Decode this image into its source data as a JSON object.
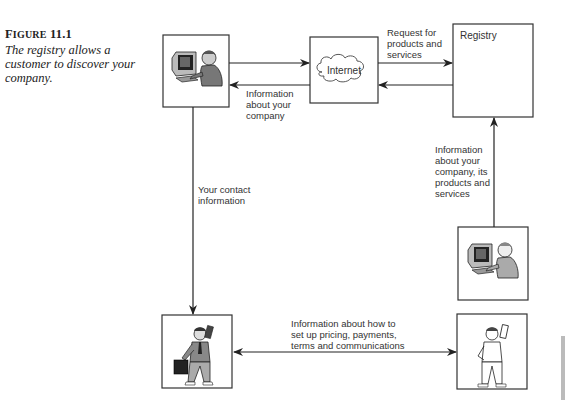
{
  "caption": {
    "figure_label_prefix": "F",
    "figure_label_smallcaps": "IGURE",
    "figure_number": "11.1",
    "text": "The registry allows a customer to discover your company."
  },
  "nodes": {
    "customer_computer": {
      "icon": "person-at-computer-icon"
    },
    "internet": {
      "label": "Internet",
      "icon": "cloud-icon"
    },
    "registry": {
      "label": "Registry"
    },
    "company_computer": {
      "icon": "person-at-computer-icon"
    },
    "customer_person": {
      "icon": "businessman-with-phone-and-briefcase-icon"
    },
    "company_person": {
      "icon": "man-with-phone-icon"
    }
  },
  "edges": {
    "request": "Request for\nproducts and\nservices",
    "info_about_company": "Information\nabout your\ncompany",
    "contact_info": "Your contact\ninformation",
    "publish_info": "Information\nabout your\ncompany, its\nproducts and\nservices",
    "setup_info": "Information about how to\nset up pricing, payments,\nterms and communications"
  }
}
